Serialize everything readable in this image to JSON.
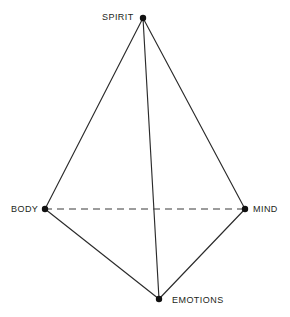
{
  "diagram": {
    "type": "tetrahedron-network-diagram",
    "background_color": "#ffffff",
    "stroke_color": "#2b2b2b",
    "dashed_stroke_color": "#3a3a3a",
    "vertex_color": "#111111",
    "label_color": "#231f20",
    "canvas": {
      "width": 290,
      "height": 317
    },
    "vertices": [
      {
        "id": "spirit",
        "label": "SPIRIT",
        "x": 143,
        "y": 18,
        "r": 3.2
      },
      {
        "id": "body",
        "label": "BODY",
        "x": 45,
        "y": 209,
        "r": 3.2
      },
      {
        "id": "mind",
        "label": "MIND",
        "x": 245,
        "y": 209,
        "r": 3.2
      },
      {
        "id": "emotions",
        "label": "EMOTIONS",
        "x": 159,
        "y": 299,
        "r": 3.2
      }
    ],
    "edges": [
      {
        "id": "spirit-body",
        "from": "spirit",
        "to": "body",
        "style": "solid"
      },
      {
        "id": "spirit-mind",
        "from": "spirit",
        "to": "mind",
        "style": "solid"
      },
      {
        "id": "spirit-emotions",
        "from": "spirit",
        "to": "emotions",
        "style": "solid"
      },
      {
        "id": "body-emotions",
        "from": "body",
        "to": "emotions",
        "style": "solid"
      },
      {
        "id": "mind-emotions",
        "from": "mind",
        "to": "emotions",
        "style": "solid"
      },
      {
        "id": "body-mind",
        "from": "body",
        "to": "mind",
        "style": "dashed"
      }
    ]
  },
  "labels": {
    "spirit": "SPIRIT",
    "body": "BODY",
    "mind": "MIND",
    "emotions": "EMOTIONS"
  }
}
